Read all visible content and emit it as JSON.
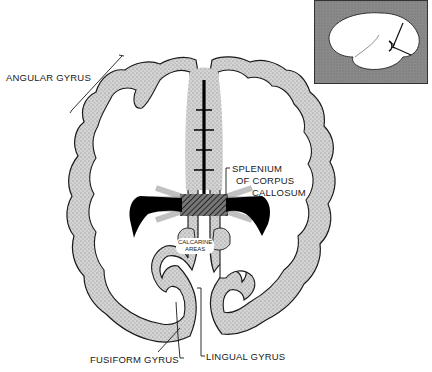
{
  "figure": {
    "type": "anatomical-diagram"
  },
  "labels": {
    "angular_gyrus": "ANGULAR GYRUS",
    "splenium_line1": "SPLENIUM",
    "splenium_line2": "OF CORPUS",
    "splenium_line3": "CALLOSUM",
    "calcarine_line1": "CALCARINE",
    "calcarine_line2": "AREAS",
    "fusiform_gyrus": "FUSIFORM GYRUS",
    "lingual_gyrus": "LINGUAL GYRUS"
  },
  "inset": {
    "description": "lateral view of brain indicating section plane",
    "background_color": "#8a8a8a"
  },
  "colors": {
    "cortex_fill": "#c9c9c9",
    "outline": "#1a1a1a",
    "ventricle": "#000000",
    "background": "#ffffff"
  }
}
